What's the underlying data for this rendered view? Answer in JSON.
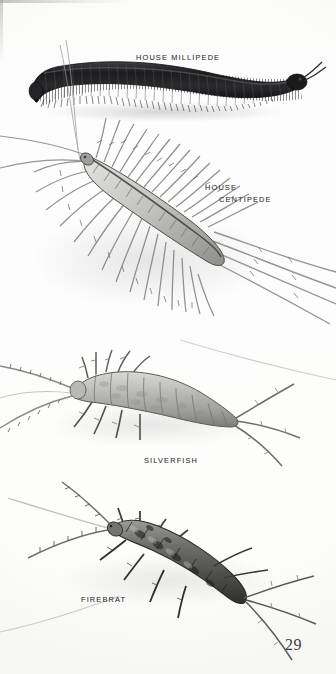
{
  "page": {
    "kind": "field-guide-illustration-plate",
    "page_number": "29",
    "background_color": "#fdfdfc",
    "ink_color": "#2b2b2d",
    "caption_color": "#39393b",
    "medium": "graphite / ink stipple drawing, grayscale"
  },
  "captions": {
    "millipede": "HOUSE MILLIPEDE",
    "centipede_line1": "HOUSE",
    "centipede_line2": "CENTIPEDE",
    "silverfish": "SILVERFISH",
    "firebrat": "FIREBRAT"
  },
  "figures": [
    {
      "id": "house-millipede",
      "label": "HOUSE MILLIPEDE",
      "order": 1,
      "description": "Dark, near-black elongated cylindrical millipede arcing left-to-right across the top of the plate, body divided into many narrow ringed segments, dense fringe of very short legs beneath, small rounded head at right with two short antennae.",
      "tone": "very dark",
      "orientation": "horizontal, gently S-curved, head to the right",
      "approx_bounds": {
        "x": 30,
        "y": 60,
        "width": 270,
        "height": 60
      }
    },
    {
      "id": "house-centipede",
      "label": "HOUSE CENTIPEDE",
      "order": 2,
      "description": "Pale banded centipede body set on a diagonal from upper-left to lower-right, surrounded by a radiating halo of many very long, slender, annulated legs plus long trailing rear legs and antennae running off to the right edge.",
      "tone": "pale body with mid-gray legs",
      "orientation": "diagonal, head upper-left",
      "approx_bounds": {
        "x": 0,
        "y": 120,
        "width": 336,
        "height": 220
      }
    },
    {
      "id": "silverfish",
      "label": "SILVERFISH",
      "order": 3,
      "description": "Pale gray teardrop-shaped silverfish with segmented, tapering abdomen, lateral bristle tufts, two long segmented antennae sweeping left and three long caudal filaments trailing right.",
      "tone": "light gray",
      "orientation": "horizontal, head to the left",
      "approx_bounds": {
        "x": 0,
        "y": 340,
        "width": 300,
        "height": 120
      }
    },
    {
      "id": "firebrat",
      "label": "FIREBRAT",
      "order": 4,
      "description": "Darker, mottled firebrat angled down to the right, body mottled with dark blotches, spiny lateral bristles, two long segmented antennae curving up and left and three long tail filaments trailing to the lower right.",
      "tone": "dark mottled gray",
      "orientation": "diagonal, head upper-left",
      "approx_bounds": {
        "x": 0,
        "y": 480,
        "width": 336,
        "height": 180
      }
    }
  ]
}
